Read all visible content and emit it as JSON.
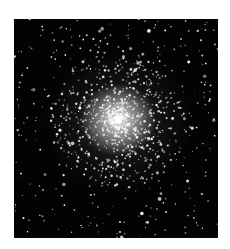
{
  "image": {
    "subject": "globular star cluster",
    "description": "Dense spherical cluster of stars with a bright white core fading into scattered stars on a black sky background",
    "colors": {
      "background_page": "#ffffff",
      "sky": "#030303",
      "core": "#ebebeb",
      "stars": "#ffffff"
    },
    "frame": {
      "x": 14,
      "y": 19,
      "width": 204,
      "height": 219
    },
    "core_center_pct": {
      "x": 51,
      "y": 46
    },
    "star_counts": {
      "core": 900,
      "field": 380
    }
  }
}
